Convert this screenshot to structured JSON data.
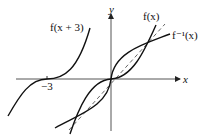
{
  "diagram": {
    "axes": {
      "x_label": "x",
      "y_label": "y"
    },
    "tick_labels": {
      "x_minus_3": "−3"
    },
    "curve_labels": {
      "f_shift": "f(x + 3)",
      "f": "f(x)",
      "f_inverse": "f⁻¹(x)"
    },
    "colors": {
      "curve": "#111111",
      "axis": "#555555",
      "dashed": "#555555"
    }
  }
}
